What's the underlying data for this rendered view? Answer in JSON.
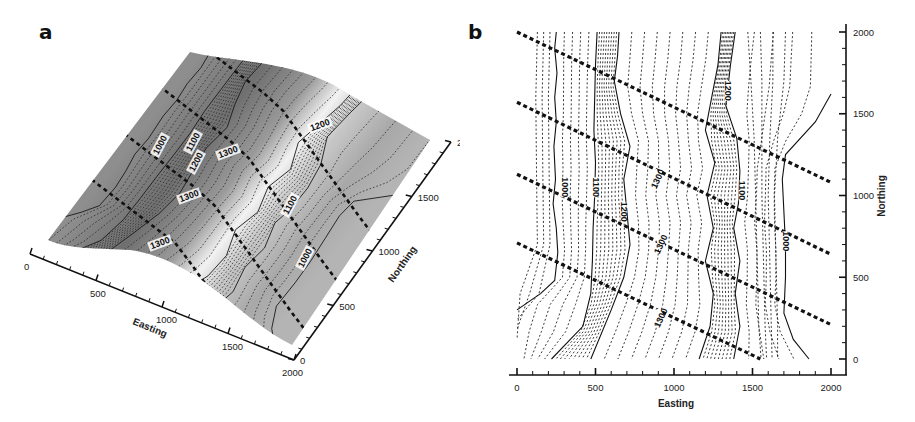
{
  "figure": {
    "panel_a": {
      "label": "a"
    },
    "panel_b": {
      "label": "b"
    }
  },
  "chart_data": [
    {
      "panel": "a",
      "type": "surface3d",
      "title": "",
      "xlabel": "Easting",
      "ylabel": "Northing",
      "x_ticks": [
        "0",
        "500",
        "1000",
        "1500",
        "2000"
      ],
      "y_ticks": [
        "0",
        "500",
        "1000",
        "1500",
        "2000"
      ],
      "xlim": [
        0,
        2000
      ],
      "ylim": [
        0,
        2000
      ],
      "contour_labels": [
        "1000",
        "1100",
        "1200",
        "1300",
        "1300",
        "1300",
        "1200",
        "1100",
        "1000"
      ],
      "notes": "Grayscale shaded 3D surface with solid (100-unit) and dotted contour lines; 4 thick dashed survey lines crossing surface"
    },
    {
      "panel": "b",
      "type": "contour",
      "title": "",
      "xlabel": "Easting",
      "ylabel": "Northing",
      "x_ticks": [
        "0",
        "500",
        "1000",
        "1500",
        "2000"
      ],
      "y_ticks": [
        "0",
        "500",
        "1000",
        "1500",
        "2000"
      ],
      "xlim": [
        0,
        2000
      ],
      "ylim": [
        -50,
        2050
      ],
      "contour_labels": [
        {
          "text": "1000",
          "E": 300,
          "N": 1050
        },
        {
          "text": "1100",
          "E": 500,
          "N": 1050
        },
        {
          "text": "1200",
          "E": 680,
          "N": 900
        },
        {
          "text": "1300",
          "E": 900,
          "N": 1100
        },
        {
          "text": "1300",
          "E": 920,
          "N": 700
        },
        {
          "text": "1300",
          "E": 920,
          "N": 250
        },
        {
          "text": "1200",
          "E": 1340,
          "N": 1640
        },
        {
          "text": "1100",
          "E": 1430,
          "N": 1030
        },
        {
          "text": "1000",
          "E": 1710,
          "N": 720
        }
      ],
      "survey_lines": [
        {
          "from": [
            0,
            2000
          ],
          "to": [
            2000,
            1080
          ]
        },
        {
          "from": [
            0,
            1570
          ],
          "to": [
            2000,
            640
          ]
        },
        {
          "from": [
            0,
            1130
          ],
          "to": [
            2000,
            210
          ]
        },
        {
          "from": [
            0,
            710
          ],
          "to": [
            1550,
            0
          ]
        }
      ],
      "solid_contours": [
        {
          "level": 1000,
          "points": [
            [
              250,
              2000
            ],
            [
              240,
              1900
            ],
            [
              255,
              1750
            ],
            [
              240,
              1600
            ],
            [
              250,
              1450
            ],
            [
              235,
              1300
            ],
            [
              245,
              1100
            ],
            [
              230,
              950
            ],
            [
              250,
              800
            ],
            [
              260,
              650
            ],
            [
              240,
              480
            ],
            [
              150,
              400
            ],
            [
              0,
              300
            ]
          ]
        },
        {
          "level": 1100,
          "points": [
            [
              510,
              2000
            ],
            [
              500,
              1800
            ],
            [
              495,
              1600
            ],
            [
              490,
              1400
            ],
            [
              500,
              1200
            ],
            [
              495,
              1000
            ],
            [
              485,
              800
            ],
            [
              480,
              600
            ],
            [
              470,
              400
            ],
            [
              420,
              200
            ],
            [
              220,
              0
            ]
          ]
        },
        {
          "level": 1200,
          "points": [
            [
              650,
              2000
            ],
            [
              640,
              1850
            ],
            [
              620,
              1700
            ],
            [
              660,
              1500
            ],
            [
              720,
              1300
            ],
            [
              680,
              1100
            ],
            [
              700,
              900
            ],
            [
              720,
              700
            ],
            [
              680,
              500
            ],
            [
              600,
              300
            ],
            [
              470,
              0
            ]
          ]
        },
        {
          "level": 1200,
          "points": [
            [
              1300,
              2000
            ],
            [
              1280,
              1800
            ],
            [
              1240,
              1600
            ],
            [
              1200,
              1400
            ],
            [
              1260,
              1200
            ],
            [
              1210,
              1000
            ],
            [
              1250,
              800
            ],
            [
              1200,
              600
            ],
            [
              1250,
              400
            ],
            [
              1230,
              200
            ],
            [
              1160,
              0
            ]
          ]
        },
        {
          "level": 1100,
          "points": [
            [
              1390,
              2000
            ],
            [
              1360,
              1800
            ],
            [
              1330,
              1550
            ],
            [
              1400,
              1350
            ],
            [
              1420,
              1150
            ],
            [
              1410,
              950
            ],
            [
              1380,
              800
            ],
            [
              1420,
              600
            ],
            [
              1390,
              400
            ],
            [
              1420,
              200
            ],
            [
              1380,
              0
            ]
          ]
        },
        {
          "level": 1000,
          "points": [
            [
              2000,
              1620
            ],
            [
              1900,
              1450
            ],
            [
              1710,
              1250
            ],
            [
              1690,
              1100
            ],
            [
              1700,
              900
            ],
            [
              1710,
              700
            ],
            [
              1710,
              500
            ],
            [
              1700,
              280
            ],
            [
              1760,
              120
            ],
            [
              1860,
              0
            ]
          ]
        }
      ]
    }
  ]
}
